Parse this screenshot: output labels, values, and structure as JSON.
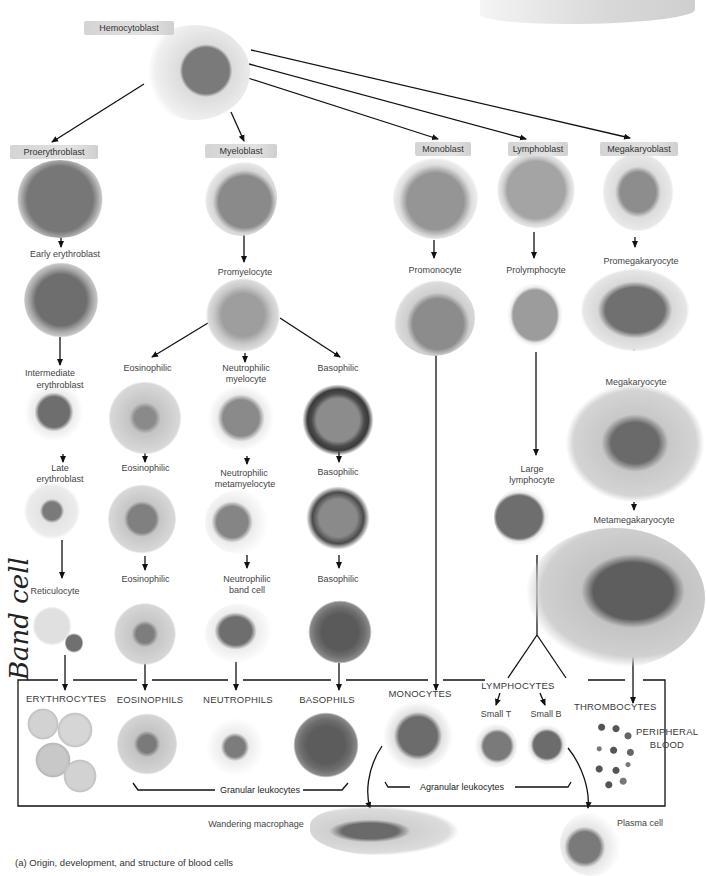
{
  "title": "Origin, development, and structure of blood cells",
  "caption": "(a) Origin, development, and structure of blood cells",
  "handwritten_note": "Band cell",
  "stem": {
    "label": "Hemocytoblast"
  },
  "blasts": [
    {
      "label": "Proerythroblast"
    },
    {
      "label": "Myeloblast"
    },
    {
      "label": "Monoblast"
    },
    {
      "label": "Lymphoblast"
    },
    {
      "label": "Megakaryoblast"
    }
  ],
  "erythroid": {
    "early": "Early erythroblast",
    "intermediate_1": "Intermediate",
    "intermediate_2": "erythroblast",
    "late_1": "Late",
    "late_2": "erythroblast",
    "reticulocyte": "Reticulocyte"
  },
  "myeloid": {
    "promyelocyte": "Promyelocyte",
    "eos_myelocyte": "Eosinophilic",
    "neut_myelocyte_1": "Neutrophilic",
    "neut_myelocyte_2": "myelocyte",
    "baso_myelocyte": "Basophilic",
    "eos_metamyelocyte": "Eosinophilic",
    "neut_metamyelocyte_1": "Neutrophilic",
    "neut_metamyelocyte_2": "metamyelocyte",
    "baso_metamyelocyte": "Basophilic",
    "eos_band": "Eosinophilic",
    "neut_band_1": "Neutrophilic",
    "neut_band_2": "band cell",
    "baso_band": "Basophilic"
  },
  "monocytic": {
    "promonocyte": "Promonocyte"
  },
  "lymphoid": {
    "prolymphocyte": "Prolymphocyte",
    "large_1": "Large",
    "large_2": "lymphocyte"
  },
  "megakaryocytic": {
    "promegakaryocyte": "Promegakaryocyte",
    "megakaryocyte": "Megakaryocyte",
    "metamegakaryocyte": "Metamegakaryocyte"
  },
  "peripheral": {
    "region_1": "PERIPHERAL",
    "region_2": "BLOOD",
    "erythrocytes": "ERYTHROCYTES",
    "eosinophils": "EOSINOPHILS",
    "neutrophils": "NEUTROPHILS",
    "basophils": "BASOPHILS",
    "monocytes": "MONOCYTES",
    "lymphocytes": "LYMPHOCYTES",
    "small_t": "Small T",
    "small_b": "Small B",
    "thrombocytes": "THROMBOCYTES",
    "granular": "Granular leukocytes",
    "agranular": "Agranular leukocytes"
  },
  "tissue": {
    "macrophage": "Wandering macrophage",
    "plasma": "Plasma cell"
  }
}
